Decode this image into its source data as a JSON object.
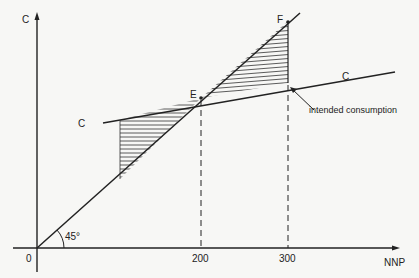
{
  "diagram": {
    "title": "",
    "axes": {
      "y_label": "C",
      "x_label": "NNP",
      "origin_label": "0",
      "x_ticks": [
        "200",
        "300"
      ]
    },
    "lines": {
      "consumption_line_left_label": "C",
      "consumption_line_right_label": "C",
      "forty_five_angle_label": "45°"
    },
    "points": {
      "equilibrium": "E",
      "upper": "F"
    },
    "annotations": {
      "arrow_note": "intended consumption"
    },
    "colors": {
      "ink": "#222222",
      "background": "#f7f7f5"
    }
  }
}
